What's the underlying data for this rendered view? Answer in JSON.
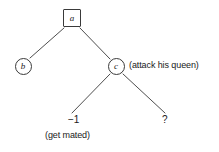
{
  "figure": {
    "kind": "game-tree-diagram",
    "background_color": "#ffffff",
    "stroke_color": "#3a3a3a",
    "text_color": "#1a1a1a"
  },
  "nodes": {
    "root": {
      "label": "a",
      "shape": "square",
      "x": 72,
      "y": 18
    },
    "left_child": {
      "label": "b",
      "shape": "circle",
      "x": 23,
      "y": 66
    },
    "right_child": {
      "label": "c",
      "shape": "circle",
      "x": 116,
      "y": 66
    }
  },
  "annotations": {
    "right_child_note": "(attack his queen)",
    "leaf_left_note": "(get mated)"
  },
  "leaves": {
    "left": {
      "value": "−1",
      "note": "(get mated)",
      "x": 78,
      "y": 122
    },
    "right": {
      "value": "?",
      "x": 165,
      "y": 122
    }
  },
  "edges": [
    {
      "from": "a",
      "to": "b"
    },
    {
      "from": "a",
      "to": "c"
    },
    {
      "from": "c",
      "to": "−1"
    },
    {
      "from": "c",
      "to": "?"
    }
  ]
}
